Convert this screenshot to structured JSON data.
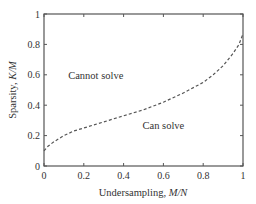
{
  "chart_data": {
    "type": "line",
    "title": "",
    "xlabel": "Undersampling, M/N",
    "xlabel_parts": {
      "text": "Undersampling, ",
      "italic": "M/N"
    },
    "ylabel": "Sparsity, K/M",
    "ylabel_parts": {
      "text": "Sparsity, ",
      "italic": "K/M"
    },
    "xlim": [
      0,
      1
    ],
    "ylim": [
      0,
      1
    ],
    "xticks": [
      0,
      0.2,
      0.4,
      0.6,
      0.8,
      1
    ],
    "xtick_labels": [
      "0",
      "0.2",
      "0.4",
      "0.6",
      "0.8",
      "1"
    ],
    "yticks": [
      0,
      0.2,
      0.4,
      0.6,
      0.8,
      1
    ],
    "ytick_labels": [
      "0",
      "0.2",
      "0.4",
      "0.6",
      "0.8",
      "1"
    ],
    "grid": false,
    "legend": null,
    "series": [
      {
        "name": "phase transition boundary",
        "style": "dashed",
        "color": "#555555",
        "x": [
          0,
          0.02,
          0.05,
          0.1,
          0.15,
          0.2,
          0.3,
          0.4,
          0.5,
          0.6,
          0.7,
          0.8,
          0.85,
          0.9,
          0.95,
          0.98,
          1.0
        ],
        "y": [
          0.1,
          0.13,
          0.16,
          0.2,
          0.23,
          0.25,
          0.29,
          0.33,
          0.37,
          0.42,
          0.48,
          0.55,
          0.6,
          0.66,
          0.74,
          0.8,
          0.87
        ]
      }
    ],
    "annotations": [
      {
        "text": "Cannot solve",
        "x": 0.26,
        "y": 0.6
      },
      {
        "text": "Can solve",
        "x": 0.6,
        "y": 0.27
      }
    ]
  }
}
